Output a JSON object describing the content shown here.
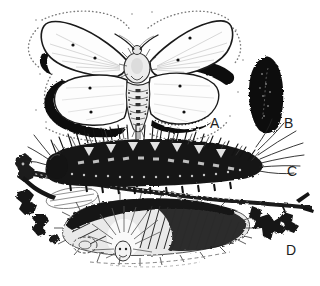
{
  "illustration": {
    "background_color": "#ffffff",
    "ink_color": "#1c1c1c",
    "labels": {
      "a": "A",
      "b": "B",
      "c": "C",
      "d": "D"
    }
  }
}
